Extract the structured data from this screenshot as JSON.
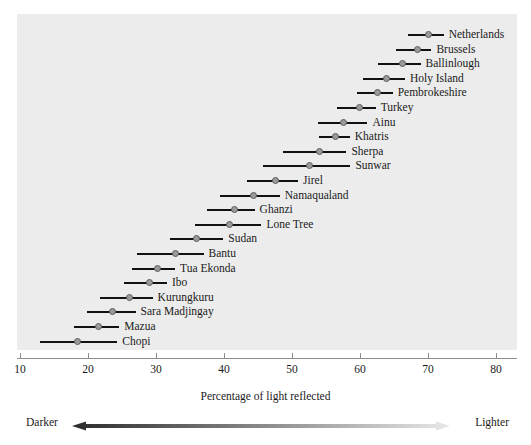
{
  "chart_data": {
    "type": "scatter",
    "title": "",
    "subtitle": "",
    "xlabel": "Percentage of light reflected",
    "ylabel": "",
    "xlim": [
      10,
      80
    ],
    "xticks": [
      10,
      20,
      30,
      40,
      50,
      60,
      70,
      80
    ],
    "xtick_labels": [
      "10",
      "20",
      "30",
      "40",
      "50",
      "60",
      "70",
      "80"
    ],
    "grid": false,
    "legend_position": "below-axis",
    "orientation": "horizontal",
    "marker": "point-with-range-line",
    "categories": [
      "Netherlands",
      "Brussels",
      "Ballinlough",
      "Holy Island",
      "Pembrokeshire",
      "Turkey",
      "Ainu",
      "Khatris",
      "Sherpa",
      "Sunwar",
      "Jirel",
      "Namaqualand",
      "Ghanzi",
      "Lone Tree",
      "Sudan",
      "Bantu",
      "Tua Ekonda",
      "Ibo",
      "Kurungkuru",
      "Sara Madjingay",
      "Mazua",
      "Chopi"
    ],
    "values": [
      70.1,
      68.4,
      66.3,
      63.9,
      62.5,
      59.9,
      57.5,
      56.4,
      54.0,
      52.6,
      47.6,
      44.4,
      41.5,
      40.8,
      36.0,
      32.9,
      30.2,
      29.1,
      26.1,
      23.6,
      21.5,
      18.5
    ],
    "range_low": [
      67.0,
      65.3,
      62.6,
      60.4,
      59.5,
      56.6,
      53.8,
      53.9,
      48.7,
      45.7,
      43.4,
      39.4,
      37.5,
      35.8,
      32.0,
      27.2,
      26.5,
      25.3,
      21.8,
      19.8,
      18.0,
      13.0
    ],
    "range_high": [
      72.3,
      70.5,
      68.9,
      66.6,
      64.8,
      62.3,
      61.1,
      58.5,
      58.0,
      58.6,
      50.9,
      48.2,
      44.5,
      45.5,
      39.9,
      37.0,
      32.8,
      31.6,
      29.5,
      27.0,
      24.6,
      24.3
    ],
    "series": [
      {
        "name": "Percentage of light reflected",
        "values": [
          70.1,
          68.4,
          66.3,
          63.9,
          62.5,
          59.9,
          57.5,
          56.4,
          54.0,
          52.6,
          47.6,
          44.4,
          41.5,
          40.8,
          36.0,
          32.9,
          30.2,
          29.1,
          26.1,
          23.6,
          21.5,
          18.5
        ]
      }
    ],
    "annotations": [
      "Darker",
      "Lighter"
    ]
  },
  "legend": {
    "left_label": "Darker",
    "right_label": "Lighter"
  },
  "colors": {
    "plot_background": "#ececec",
    "bar": "#111111",
    "marker_fill": "#9a9a9a",
    "marker_edge": "#5d5d5d",
    "axis": "#8e8e8e",
    "text": "#1a1a1a",
    "gradient_dark": "#2b2b2b",
    "gradient_light": "#e8e8e8"
  }
}
